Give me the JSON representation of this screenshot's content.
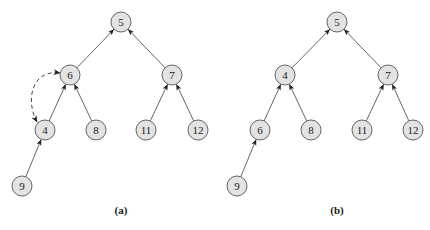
{
  "diagram": {
    "type": "binary-heap-trees",
    "node_fill": "#e3e3e3",
    "node_stroke": "#555555",
    "arrow_color": "#222222",
    "trees": [
      {
        "id": "a",
        "caption": "(a)",
        "nodes": [
          {
            "id": "a5",
            "label": "5"
          },
          {
            "id": "a6",
            "label": "6"
          },
          {
            "id": "a7",
            "label": "7"
          },
          {
            "id": "a4",
            "label": "4"
          },
          {
            "id": "a8",
            "label": "8"
          },
          {
            "id": "a11",
            "label": "11"
          },
          {
            "id": "a12",
            "label": "12"
          },
          {
            "id": "a9",
            "label": "9"
          }
        ],
        "edges": [
          {
            "from": "a6",
            "to": "a5"
          },
          {
            "from": "a7",
            "to": "a5"
          },
          {
            "from": "a4",
            "to": "a6"
          },
          {
            "from": "a8",
            "to": "a6"
          },
          {
            "from": "a11",
            "to": "a7"
          },
          {
            "from": "a12",
            "to": "a7"
          },
          {
            "from": "a9",
            "to": "a4"
          }
        ],
        "swap": {
          "between": [
            "a4",
            "a6"
          ],
          "style": "dashed-curved-double-arrow"
        }
      },
      {
        "id": "b",
        "caption": "(b)",
        "nodes": [
          {
            "id": "b5",
            "label": "5"
          },
          {
            "id": "b4",
            "label": "4"
          },
          {
            "id": "b7",
            "label": "7"
          },
          {
            "id": "b6",
            "label": "6"
          },
          {
            "id": "b8",
            "label": "8"
          },
          {
            "id": "b11",
            "label": "11"
          },
          {
            "id": "b12",
            "label": "12"
          },
          {
            "id": "b9",
            "label": "9"
          }
        ],
        "edges": [
          {
            "from": "b4",
            "to": "b5"
          },
          {
            "from": "b7",
            "to": "b5"
          },
          {
            "from": "b6",
            "to": "b4"
          },
          {
            "from": "b8",
            "to": "b4"
          },
          {
            "from": "b11",
            "to": "b7"
          },
          {
            "from": "b12",
            "to": "b7"
          },
          {
            "from": "b9",
            "to": "b6"
          }
        ]
      }
    ]
  }
}
